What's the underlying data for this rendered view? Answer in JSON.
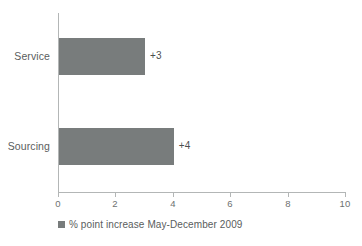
{
  "chart_data": {
    "type": "bar",
    "orientation": "horizontal",
    "title": "",
    "subtitle": "",
    "xlabel": "",
    "ylabel": "",
    "categories": [
      "Service",
      "Sourcing"
    ],
    "values": [
      3,
      4
    ],
    "value_labels": [
      "+3",
      "+4"
    ],
    "series": [
      {
        "name": "% point increase May-December 2009",
        "values": [
          3,
          4
        ],
        "color": "#787c7c"
      }
    ],
    "xlim": [
      0,
      10
    ],
    "xticks": [
      0,
      2,
      4,
      6,
      8,
      10
    ],
    "xtick_labels": [
      "0",
      "2",
      "4",
      "6",
      "8",
      "10"
    ],
    "grid": false,
    "legend": {
      "position": "bottom-left",
      "entries": [
        {
          "label": "% point increase May-December 2009",
          "color": "#787c7c",
          "marker": "square-swatch"
        }
      ]
    },
    "colors": {
      "bar": "#787c7c",
      "axis": "#b3b6b6",
      "tick_text": "#6d7070",
      "label_text": "#5a5d5d",
      "value_text": "#4c4f4f",
      "background": "#ffffff"
    }
  }
}
